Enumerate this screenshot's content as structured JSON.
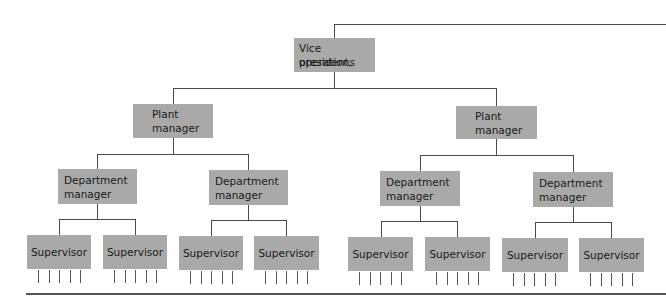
{
  "diagram": {
    "type": "org-chart",
    "colors": {
      "box_fill": "#a9a9a9",
      "line": "#4a4a4a",
      "background": "#ffffff"
    },
    "root": {
      "label_line1": "Vice president,",
      "label_line2": "operations",
      "children": [
        {
          "label_line1": "Plant",
          "label_line2": "manager",
          "children": [
            {
              "label_line1": "Department",
              "label_line2": "manager",
              "children": [
                {
                  "label": "Supervisor",
                  "reports": 5
                },
                {
                  "label": "Supervisor",
                  "reports": 5
                }
              ]
            },
            {
              "label_line1": "Department",
              "label_line2": "manager",
              "children": [
                {
                  "label": "Supervisor",
                  "reports": 5
                },
                {
                  "label": "Supervisor",
                  "reports": 5
                }
              ]
            }
          ]
        },
        {
          "label_line1": "Plant",
          "label_line2": "manager",
          "children": [
            {
              "label_line1": "Department",
              "label_line2": "manager",
              "children": [
                {
                  "label": "Supervisor",
                  "reports": 5
                },
                {
                  "label": "Supervisor",
                  "reports": 5
                }
              ]
            },
            {
              "label_line1": "Department",
              "label_line2": "manager",
              "children": [
                {
                  "label": "Supervisor",
                  "reports": 5
                },
                {
                  "label": "Supervisor",
                  "reports": 5
                }
              ]
            }
          ]
        }
      ]
    }
  }
}
